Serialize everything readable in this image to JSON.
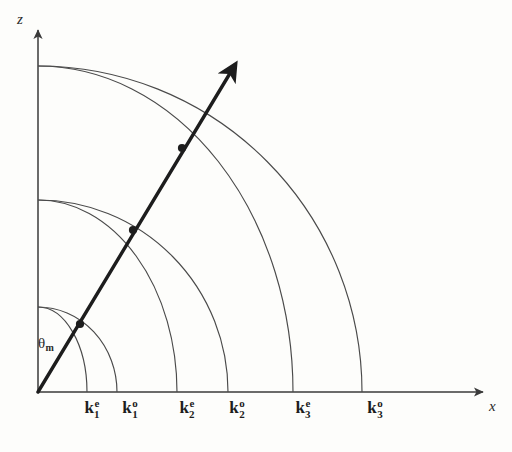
{
  "figure": {
    "kind": "wave-vector-index-surface-diagram",
    "background_color": "#fdfdfb",
    "ink_color": "#3a3a3a",
    "bold_ink_color": "#1d1d1d",
    "width": 512,
    "height": 452
  },
  "axes": {
    "origin": {
      "x": 38,
      "y": 392
    },
    "vertical": {
      "name": "z",
      "label": "z",
      "label_pos": {
        "x": 17,
        "y": 12
      },
      "tip": {
        "x": 38,
        "y": 26
      }
    },
    "horizontal": {
      "name": "x",
      "label": "x",
      "label_pos": {
        "x": 489,
        "y": 399
      },
      "tip": {
        "x": 487,
        "y": 392
      }
    }
  },
  "angle_annotation": {
    "symbol": "θ",
    "subscript": "m",
    "label": "θm",
    "pos": {
      "x": 38,
      "y": 336
    },
    "measured_from": "z",
    "degrees": 31
  },
  "ray": {
    "label": "propagation direction",
    "from": {
      "x": 38,
      "y": 392
    },
    "to": {
      "x": 235,
      "y": 65
    },
    "stroke_width": 3.4,
    "has_arrowhead": true
  },
  "intersection_points": [
    {
      "x": 80,
      "y": 324,
      "on_arc": "k1"
    },
    {
      "x": 133,
      "y": 230,
      "on_arc": "k2"
    },
    {
      "x": 182,
      "y": 148,
      "on_arc": "k3"
    }
  ],
  "arcs": [
    {
      "id": "k1e",
      "polarization": "e",
      "order": 1,
      "x_intercept": 87,
      "z_intercept": 307
    },
    {
      "id": "k1o",
      "polarization": "o",
      "order": 1,
      "x_intercept": 117,
      "z_intercept": 307
    },
    {
      "id": "k2e",
      "polarization": "e",
      "order": 2,
      "x_intercept": 177,
      "z_intercept": 200
    },
    {
      "id": "k2o",
      "polarization": "o",
      "order": 2,
      "x_intercept": 228,
      "z_intercept": 200
    },
    {
      "id": "k3e",
      "polarization": "e",
      "order": 3,
      "x_intercept": 293,
      "z_intercept": 66
    },
    {
      "id": "k3o",
      "polarization": "o",
      "order": 3,
      "x_intercept": 362,
      "z_intercept": 66
    }
  ],
  "tick_labels": [
    {
      "id": "k1e",
      "base": "k",
      "superscript": "e",
      "subscript": "1",
      "text": "k1e",
      "x": 92
    },
    {
      "id": "k1o",
      "base": "k",
      "superscript": "o",
      "subscript": "1",
      "text": "k1o",
      "x": 130
    },
    {
      "id": "k2e",
      "base": "k",
      "superscript": "e",
      "subscript": "2",
      "text": "k2e",
      "x": 187
    },
    {
      "id": "k2o",
      "base": "k",
      "superscript": "o",
      "subscript": "2",
      "text": "k2o",
      "x": 237
    },
    {
      "id": "k3e",
      "base": "k",
      "superscript": "e",
      "subscript": "3",
      "text": "k3e",
      "x": 303
    },
    {
      "id": "k3o",
      "base": "k",
      "superscript": "o",
      "subscript": "3",
      "text": "k3o",
      "x": 375
    }
  ]
}
